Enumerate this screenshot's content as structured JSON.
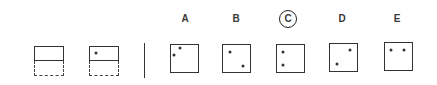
{
  "diagram": {
    "title": "",
    "type": "visual reasoning puzzle (paper folding / dot placement)",
    "colors": {
      "line": "#333333",
      "label": "#3a3a3a",
      "background": "#ffffff"
    },
    "question_figures": [
      {
        "id": "q1",
        "description": "rectangle folded: solid top half, dashed bottom half, empty",
        "dots": []
      },
      {
        "id": "q2",
        "description": "rectangle folded: solid top half with one dot near upper-left, dashed bottom half",
        "dots": [
          {
            "x": 96,
            "y": 53
          }
        ]
      }
    ],
    "options": [
      {
        "label": "A",
        "circled": false,
        "dots": [
          {
            "x": 180,
            "y": 48
          },
          {
            "x": 174,
            "y": 55
          }
        ]
      },
      {
        "label": "B",
        "circled": false,
        "dots": [
          {
            "x": 230,
            "y": 52
          },
          {
            "x": 243,
            "y": 66
          }
        ]
      },
      {
        "label": "C",
        "circled": true,
        "dots": [
          {
            "x": 283,
            "y": 52
          },
          {
            "x": 283,
            "y": 65
          }
        ]
      },
      {
        "label": "D",
        "circled": false,
        "dots": [
          {
            "x": 350,
            "y": 50
          },
          {
            "x": 337,
            "y": 64
          }
        ]
      },
      {
        "label": "E",
        "circled": false,
        "dots": [
          {
            "x": 391,
            "y": 50
          },
          {
            "x": 404,
            "y": 50
          }
        ]
      }
    ],
    "answer": "C"
  }
}
